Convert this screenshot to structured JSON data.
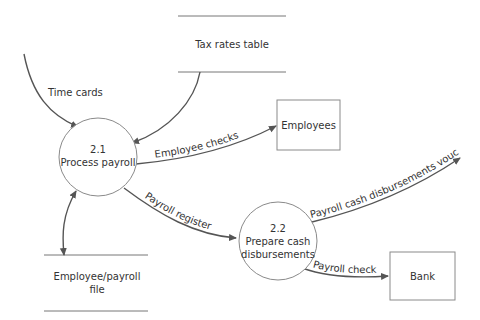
{
  "diagram": {
    "type": "data-flow-diagram",
    "processes": [
      {
        "id": "2.1",
        "number": "2.1",
        "name": "Process payroll"
      },
      {
        "id": "2.2",
        "number": "2.2",
        "name_line1": "Prepare cash",
        "name_line2": "disbursements"
      }
    ],
    "data_stores": [
      {
        "id": "tax",
        "name": "Tax rates table"
      },
      {
        "id": "emp_file",
        "name_line1": "Employee/payroll",
        "name_line2": "file"
      }
    ],
    "entities": [
      {
        "id": "employees",
        "name": "Employees"
      },
      {
        "id": "bank",
        "name": "Bank"
      }
    ],
    "flows": [
      {
        "label": "Time cards",
        "from": "external",
        "to": "2.1"
      },
      {
        "label": "",
        "from": "tax",
        "to": "2.1"
      },
      {
        "label": "Employee checks",
        "from": "2.1",
        "to": "employees"
      },
      {
        "label": "Payroll register",
        "from": "2.1",
        "to": "2.2"
      },
      {
        "label": "",
        "from": "2.1",
        "to": "emp_file",
        "bidirectional": true
      },
      {
        "label": "Payroll cash disbursements voucher",
        "from": "2.2",
        "to": "external"
      },
      {
        "label": "Payroll check",
        "from": "2.2",
        "to": "bank"
      }
    ],
    "colors": {
      "line": "#555555",
      "shape": "#8a8a8a",
      "text": "#333333"
    }
  }
}
